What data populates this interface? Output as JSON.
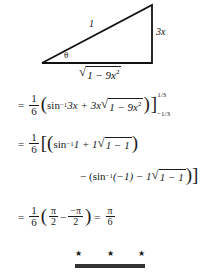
{
  "figure": {
    "name": "right-triangle-reference",
    "hypotenuse_label": "1",
    "opposite_label": "3x",
    "angle_label": "θ",
    "base_radical_sign": "√",
    "base_label": "1 − 9x",
    "base_exponent": "2",
    "stroke_color": "#111111"
  },
  "solution": {
    "line1": {
      "equals": "=",
      "coef_num": "1",
      "coef_den": "6",
      "open_paren": "(",
      "fn": "sin",
      "fn_exp": "−1",
      "arg": " 3x + 3x",
      "radical_sign": "√",
      "radicand": "1 − 9x",
      "radicand_exp": "2",
      "close_paren": ")",
      "bracket": "]",
      "upper_limit": "1/3",
      "lower_limit": "−1/3"
    },
    "line2": {
      "equals": "=",
      "coef_num": "1",
      "coef_den": "6",
      "brackets": "[(",
      "fn": "sin",
      "fn_exp": "−1",
      "arg": " 1 + 1",
      "radical_sign": "√",
      "radicand": "1 − 1",
      "close_paren": ")"
    },
    "line3": {
      "minus": "− (",
      "fn": "sin",
      "fn_exp": "−1",
      "arg": " (−1) − 1",
      "radical_sign": "√",
      "radicand": "1 − 1",
      "close": ")]"
    },
    "line4": {
      "equals": "=",
      "coef_num": "1",
      "coef_den": "6",
      "open_paren": "(",
      "term1_num": "π",
      "term1_den": "2",
      "operator": "−",
      "term2_num": "−π",
      "term2_den": "2",
      "close_paren": ")",
      "equals2": "=",
      "result_num": "π",
      "result_den": "6"
    }
  },
  "footer": {
    "stars": [
      "★",
      "★",
      "★"
    ],
    "rule_color": "#333333"
  }
}
